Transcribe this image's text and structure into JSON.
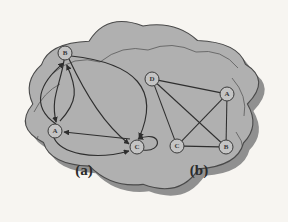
{
  "figure": {
    "title": "",
    "background_color": "#f7f5f1",
    "cloud_fill": "#b0b0b0",
    "cloud_stroke": "#4a4a4a",
    "cloud_shadow": "#8a8a8a",
    "edge_color": "#2e2e2e",
    "node_fill": "#c4c4c4",
    "node_stroke": "#3a3a3a",
    "node_radius": 7
  },
  "panels": [
    {
      "id": "a",
      "label": "(a)",
      "label_x": 84,
      "label_y": 170,
      "graph_type": "directed",
      "nodes": [
        {
          "id": "B",
          "label": "B",
          "x": 65,
          "y": 53
        },
        {
          "id": "A",
          "label": "A",
          "x": 55,
          "y": 131
        },
        {
          "id": "C",
          "label": "C",
          "x": 137,
          "y": 147
        }
      ],
      "edges": [
        {
          "from": "A",
          "to": "B",
          "kind": "curve-left",
          "directed": true
        },
        {
          "from": "B",
          "to": "A",
          "kind": "curve-inner",
          "directed": true
        },
        {
          "from": "A",
          "to": "B",
          "kind": "curve-inner2",
          "directed": true
        },
        {
          "from": "B",
          "to": "C",
          "kind": "curve-wide",
          "directed": true
        },
        {
          "from": "B",
          "to": "C",
          "kind": "curve-mid",
          "directed": true
        },
        {
          "from": "C",
          "to": "A",
          "kind": "straight",
          "directed": true
        },
        {
          "from": "A",
          "to": "C",
          "kind": "curve-below",
          "directed": true
        },
        {
          "from": "C",
          "to": "C",
          "kind": "self-loop",
          "directed": true
        }
      ]
    },
    {
      "id": "b",
      "label": "(b)",
      "label_x": 199,
      "label_y": 170,
      "graph_type": "undirected",
      "nodes": [
        {
          "id": "D",
          "label": "D",
          "x": 152,
          "y": 79
        },
        {
          "id": "A",
          "label": "A",
          "x": 227,
          "y": 94
        },
        {
          "id": "C",
          "label": "C",
          "x": 177,
          "y": 146
        },
        {
          "id": "B",
          "label": "B",
          "x": 226,
          "y": 147
        }
      ],
      "edges": [
        {
          "from": "D",
          "to": "A",
          "directed": false
        },
        {
          "from": "D",
          "to": "C",
          "directed": false
        },
        {
          "from": "D",
          "to": "B",
          "directed": false
        },
        {
          "from": "A",
          "to": "C",
          "directed": false
        },
        {
          "from": "A",
          "to": "B",
          "directed": false
        },
        {
          "from": "C",
          "to": "B",
          "directed": false
        }
      ]
    }
  ]
}
